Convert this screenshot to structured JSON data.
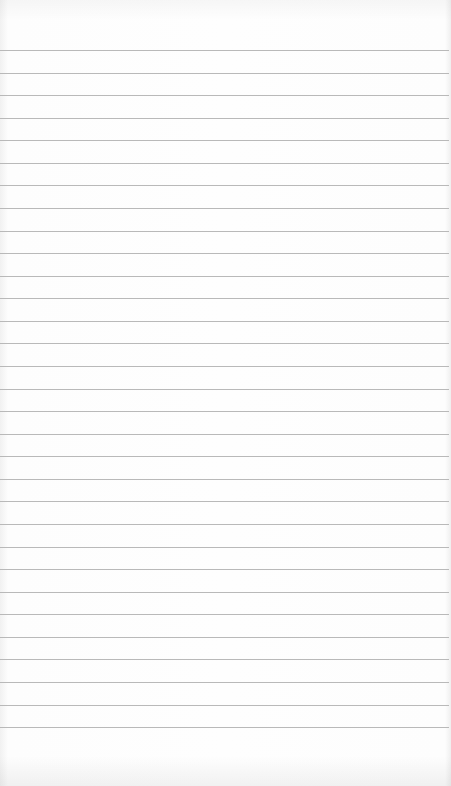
{
  "page": {
    "type": "lined-notepad",
    "background_color": "#fdfdfd",
    "line_color": "#b9b9b9",
    "line_count": 31,
    "first_line_y": 50,
    "line_spacing": 22.57,
    "content_text": ""
  }
}
